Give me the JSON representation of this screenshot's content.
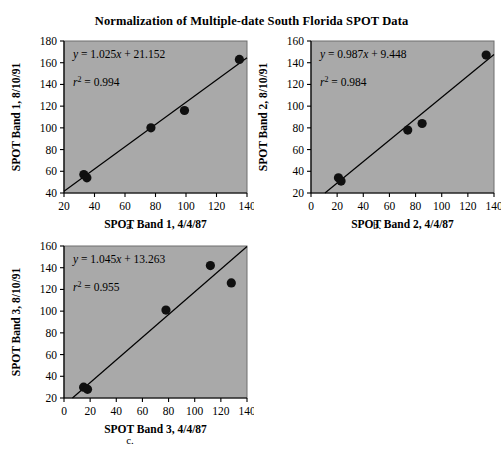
{
  "figure": {
    "title": "Normalization of Multiple-date South Florida SPOT Data"
  },
  "panels": [
    {
      "caption": "a.",
      "equation": "y = 1.025x + 21.152",
      "r2": "r2 = 0.994"
    },
    {
      "caption": "b.",
      "equation": "y = 0.987x + 9.448",
      "r2": "r2 = 0.984"
    },
    {
      "caption": "c.",
      "equation": "y = 1.045x + 13.263",
      "r2": "r2 = 0.955"
    }
  ],
  "chart_data": [
    {
      "type": "scatter",
      "title": "",
      "panel_label": "a.",
      "xlabel": "SPOT Band 1, 4/4/87",
      "ylabel": "SPOT Band 1, 8/10/91",
      "xlim": [
        20,
        140
      ],
      "ylim": [
        40,
        180
      ],
      "xticks": [
        20,
        40,
        60,
        80,
        100,
        120,
        140
      ],
      "yticks": [
        40,
        60,
        80,
        100,
        120,
        140,
        160,
        180
      ],
      "grid": false,
      "legend": "none",
      "points": [
        {
          "x": 33,
          "y": 57
        },
        {
          "x": 35,
          "y": 54
        },
        {
          "x": 77,
          "y": 100
        },
        {
          "x": 99,
          "y": 116
        },
        {
          "x": 135,
          "y": 163
        }
      ],
      "fit": {
        "slope": 1.025,
        "intercept": 21.152,
        "r_squared": 0.994,
        "equation_text": "y = 1.025x + 21.152",
        "r2_text": "r2 = 0.994"
      }
    },
    {
      "type": "scatter",
      "title": "",
      "panel_label": "b.",
      "xlabel": "SPOT Band 2, 4/4/87",
      "ylabel": "SPOT Band 2, 8/10/91",
      "xlim": [
        0,
        140
      ],
      "ylim": [
        20,
        160
      ],
      "xticks": [
        0,
        20,
        40,
        60,
        80,
        100,
        120,
        140
      ],
      "yticks": [
        20,
        40,
        60,
        80,
        100,
        120,
        140,
        160
      ],
      "grid": false,
      "legend": "none",
      "points": [
        {
          "x": 21,
          "y": 34
        },
        {
          "x": 23,
          "y": 31
        },
        {
          "x": 74,
          "y": 78
        },
        {
          "x": 85,
          "y": 84
        },
        {
          "x": 134,
          "y": 147
        }
      ],
      "fit": {
        "slope": 0.987,
        "intercept": 9.448,
        "r_squared": 0.984,
        "equation_text": "y = 0.987x + 9.448",
        "r2_text": "r2 = 0.984"
      }
    },
    {
      "type": "scatter",
      "title": "",
      "panel_label": "c.",
      "xlabel": "SPOT Band 3, 4/4/87",
      "ylabel": "SPOT Band 3, 8/10/91",
      "xlim": [
        0,
        140
      ],
      "ylim": [
        20,
        160
      ],
      "xticks": [
        0,
        20,
        40,
        60,
        80,
        100,
        120,
        140
      ],
      "yticks": [
        20,
        40,
        60,
        80,
        100,
        120,
        140,
        160
      ],
      "grid": false,
      "legend": "none",
      "points": [
        {
          "x": 15,
          "y": 30
        },
        {
          "x": 18,
          "y": 28
        },
        {
          "x": 78,
          "y": 101
        },
        {
          "x": 112,
          "y": 142
        },
        {
          "x": 128,
          "y": 126
        }
      ],
      "fit": {
        "slope": 1.045,
        "intercept": 13.263,
        "r_squared": 0.955,
        "equation_text": "y = 1.045x + 13.263",
        "r2_text": "r2 = 0.955"
      }
    }
  ]
}
